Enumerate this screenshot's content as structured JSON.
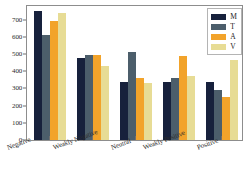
{
  "chart_data": {
    "type": "bar",
    "title": "",
    "subtitle": "",
    "xlabel": "",
    "ylabel": "",
    "ylim": [
      0,
      780
    ],
    "yticks": [
      0,
      100,
      200,
      300,
      400,
      500,
      600,
      700
    ],
    "grid": false,
    "legend_position": "top-right",
    "categories": [
      "Negative",
      "Weakly Negative",
      "Neutral",
      "Weakly Positive",
      "Positive"
    ],
    "series": [
      {
        "name": "M",
        "color": "#17213c",
        "values": [
          752,
          480,
          340,
          340,
          340
        ]
      },
      {
        "name": "T",
        "color": "#4c5e6b",
        "values": [
          610,
          492,
          512,
          360,
          290
        ]
      },
      {
        "name": "A",
        "color": "#f2a32a",
        "values": [
          695,
          492,
          362,
          490,
          250
        ]
      },
      {
        "name": "V",
        "color": "#e7dc95",
        "values": [
          738,
          432,
          332,
          375,
          465
        ]
      }
    ]
  },
  "legend": {
    "items": [
      {
        "label": "M",
        "key": "m"
      },
      {
        "label": "T",
        "key": "t"
      },
      {
        "label": "A",
        "key": "a"
      },
      {
        "label": "V",
        "key": "v"
      }
    ]
  },
  "axes": {
    "y_tick_labels": [
      "0",
      "100",
      "200",
      "300",
      "400",
      "500",
      "600",
      "700"
    ],
    "x_tick_labels": [
      "Negative",
      "Weakly Negative",
      "Neutral",
      "Weakly Positive",
      "Positive"
    ]
  }
}
